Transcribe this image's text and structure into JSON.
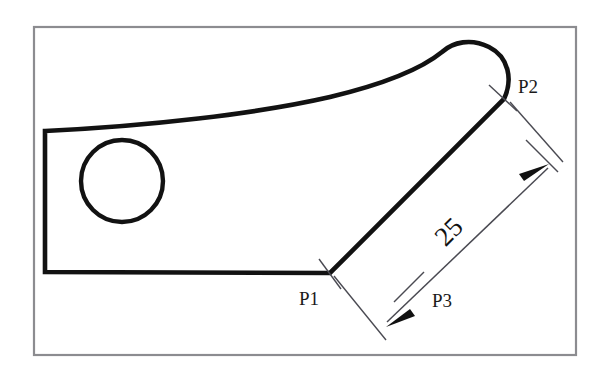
{
  "drawing": {
    "title": "Technical part outline with linear dimension",
    "background_color": "#ffffff",
    "frame": {
      "name": "drawing-border",
      "x": 34,
      "y": 27,
      "width": 542,
      "height": 328,
      "stroke_color": "#8c8c90"
    },
    "part": {
      "outline_color": "#121212",
      "outline_path": "M 45 130 L 45 272 L 330 273 L 505 98",
      "top_curve_path": "M 505 98 C 512 80 508 58 489 47 C 470 37 452 42 441 52 C 399 84 300 106 175 119 C 128 124 82 128 45 130 Z",
      "hole": {
        "name": "circular-hole",
        "cx": 122,
        "cy": 181,
        "r": 41
      }
    },
    "dimension": {
      "value": "25",
      "value_rotation_deg": -45,
      "value_x": 455,
      "value_y": 238,
      "line_color": "#4a4a52",
      "arrow_color": "#111111",
      "dim_start": {
        "x": 390,
        "y": 325
      },
      "dim_end": {
        "x": 545,
        "y": 165
      },
      "ext_line_from_p1": {
        "x1": 335,
        "y1": 277,
        "x2": 385,
        "y2": 337
      },
      "ext_line_from_p2": {
        "x1": 511,
        "y1": 103,
        "x2": 562,
        "y2": 160
      },
      "tick_p3": {
        "x1": 396,
        "y1": 300,
        "x2": 424,
        "y2": 272
      },
      "tick_upper": {
        "x1": 528,
        "y1": 141,
        "x2": 556,
        "y2": 169
      }
    },
    "points": [
      {
        "name": "point-label-p1",
        "label": "P1",
        "x": 299,
        "y": 305,
        "marker": {
          "x1": 318,
          "y1": 260,
          "x2": 340,
          "y2": 288
        }
      },
      {
        "name": "point-label-p2",
        "label": "P2",
        "x": 516,
        "y": 92,
        "marker": {
          "x1": 490,
          "y1": 86,
          "x2": 516,
          "y2": 110
        }
      },
      {
        "name": "point-label-p3",
        "label": "P3",
        "x": 432,
        "y": 307,
        "marker": {
          "x1": 396,
          "y1": 300,
          "x2": 424,
          "y2": 272
        }
      }
    ]
  }
}
